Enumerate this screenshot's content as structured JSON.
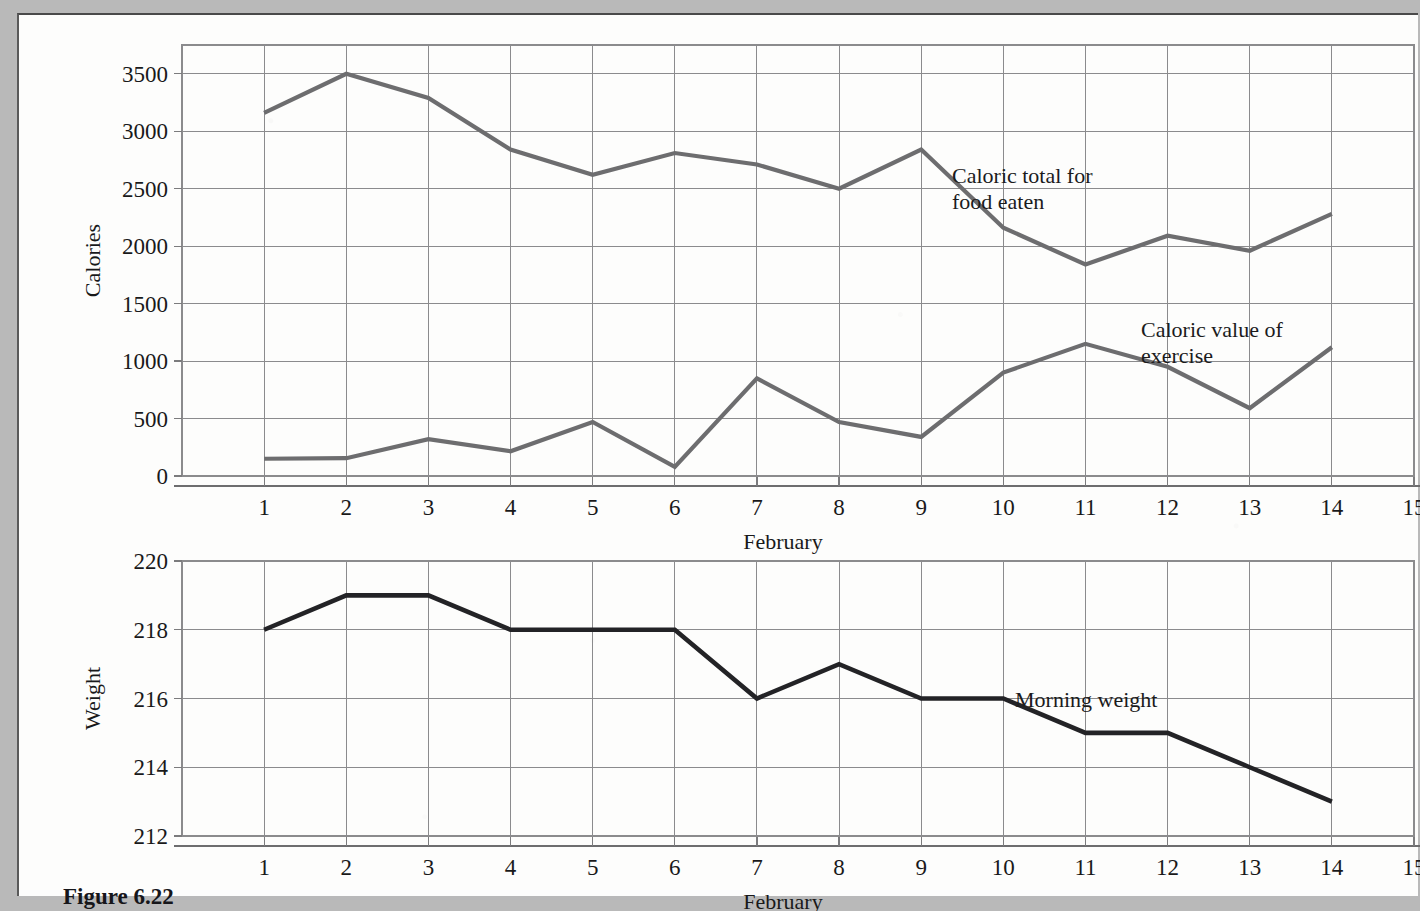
{
  "figure": {
    "caption": "Figure 6.22"
  },
  "chart_data": [
    {
      "type": "line",
      "id": "calories-chart",
      "title": "",
      "xlabel": "February",
      "ylabel": "Calories",
      "x": [
        1,
        2,
        3,
        4,
        5,
        6,
        7,
        8,
        9,
        10,
        11,
        12,
        13,
        14
      ],
      "xlim": [
        0,
        15
      ],
      "ylim": [
        0,
        3750
      ],
      "xticks": [
        1,
        2,
        3,
        4,
        5,
        6,
        7,
        8,
        9,
        10,
        11,
        12,
        13,
        14,
        15
      ],
      "xtick_labels": [
        "1",
        "2",
        "3",
        "4",
        "5",
        "6",
        "7",
        "8",
        "9",
        "10",
        "11",
        "12",
        "13",
        "14",
        "15"
      ],
      "yticks": [
        0,
        500,
        1000,
        1500,
        2000,
        2500,
        3000,
        3500
      ],
      "ytick_labels": [
        "0",
        "500",
        "1000",
        "1500",
        "2000",
        "2500",
        "3000",
        "3500"
      ],
      "grid": true,
      "legend_position": "inline-annotation",
      "series": [
        {
          "name": "Caloric total for food eaten",
          "color": "#6d6d6f",
          "values": [
            3160,
            3500,
            3290,
            2840,
            2620,
            2810,
            2710,
            2500,
            2840,
            2160,
            1840,
            2090,
            1960,
            2280
          ],
          "annotation": "Caloric total for\nfood eaten",
          "annotation_line1": "Caloric total for",
          "annotation_line2": "food eaten"
        },
        {
          "name": "Caloric value of exercise",
          "color": "#6d6d6f",
          "values": [
            150,
            155,
            320,
            215,
            470,
            80,
            850,
            470,
            340,
            900,
            1150,
            950,
            590,
            1120
          ],
          "annotation": "Caloric value of\nexercise",
          "annotation_line1": "Caloric value of",
          "annotation_line2": "exercise"
        }
      ]
    },
    {
      "type": "line",
      "id": "weight-chart",
      "title": "",
      "xlabel": "February",
      "ylabel": "Weight",
      "x": [
        1,
        2,
        3,
        4,
        5,
        6,
        7,
        8,
        9,
        10,
        11,
        12,
        13,
        14
      ],
      "xlim": [
        0,
        15
      ],
      "ylim": [
        212,
        220
      ],
      "xticks": [
        1,
        2,
        3,
        4,
        5,
        6,
        7,
        8,
        9,
        10,
        11,
        12,
        13,
        14,
        15
      ],
      "xtick_labels": [
        "1",
        "2",
        "3",
        "4",
        "5",
        "6",
        "7",
        "8",
        "9",
        "10",
        "11",
        "12",
        "13",
        "14",
        "15"
      ],
      "yticks": [
        212,
        214,
        216,
        218,
        220
      ],
      "ytick_labels": [
        "212",
        "214",
        "216",
        "218",
        "220"
      ],
      "grid": true,
      "legend_position": "inline-annotation",
      "series": [
        {
          "name": "Morning weight",
          "color": "#232326",
          "values": [
            218,
            219,
            219,
            218,
            218,
            218,
            216,
            217,
            216,
            216,
            215,
            215,
            214,
            213
          ],
          "annotation": "Morning weight",
          "annotation_line1": "Morning weight",
          "annotation_line2": ""
        }
      ]
    }
  ]
}
